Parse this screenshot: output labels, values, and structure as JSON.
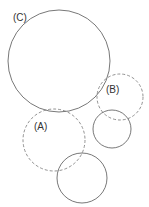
{
  "diagram": {
    "labels": {
      "C": "(C)",
      "B": "(B)",
      "A": "(A)"
    },
    "colors": {
      "stroke": "#555555",
      "background": "#ffffff"
    },
    "circles": [
      {
        "id": "C",
        "style": "solid",
        "cx": 59,
        "cy": 61,
        "r": 51
      },
      {
        "id": "B",
        "style": "dashed",
        "cx": 120,
        "cy": 97,
        "r": 23
      },
      {
        "id": "B-solid",
        "style": "solid",
        "cx": 112,
        "cy": 129,
        "r": 19
      },
      {
        "id": "A",
        "style": "dashed",
        "cx": 54,
        "cy": 140,
        "r": 31
      },
      {
        "id": "A-solid",
        "style": "solid",
        "cx": 82,
        "cy": 178,
        "r": 25
      }
    ]
  }
}
